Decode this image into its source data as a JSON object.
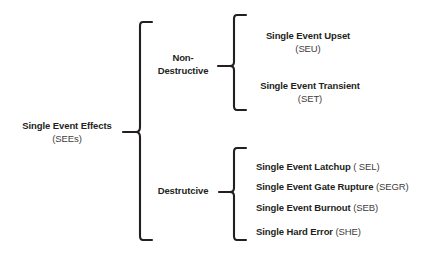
{
  "diagram": {
    "type": "hierarchy-tree-bracket",
    "orientation": "left-to-right",
    "background_color": "#ffffff",
    "line_color": "#231f20",
    "text_color": "#231f20",
    "acronym_color": "#3f3c3d"
  },
  "root": {
    "label": "Single Event Effects",
    "acronym": "(SEEs)"
  },
  "categories": [
    {
      "id": "non-destructive",
      "line1": "Non-",
      "line2": "Destructive",
      "leaves": [
        {
          "id": "seu",
          "label": "Single Event Upset",
          "acronym": "(SEU)"
        },
        {
          "id": "set",
          "label": "Single Event Transient",
          "acronym": "(SET)"
        }
      ]
    },
    {
      "id": "destructive",
      "line1": "Destrutcive",
      "line2": "",
      "leaves": [
        {
          "id": "sel",
          "label": "Single Event Latchup",
          "acronym": "( SEL)"
        },
        {
          "id": "segr",
          "label": "Single Event Gate Rupture",
          "acronym": "(SEGR)"
        },
        {
          "id": "seb",
          "label": "Single Event Burnout",
          "acronym": "(SEB)"
        },
        {
          "id": "she",
          "label": "Single Hard Error",
          "acronym": "(SHE)"
        }
      ]
    }
  ]
}
